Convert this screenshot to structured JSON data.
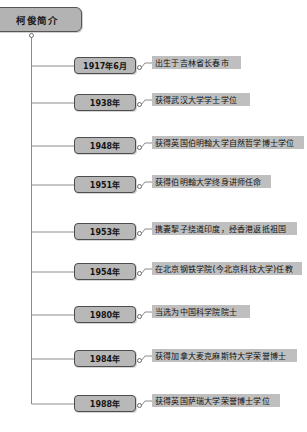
{
  "diagram": {
    "type": "timeline-mindmap",
    "root": {
      "label": "柯俊简介"
    },
    "entries": [
      {
        "date": "1917年6月",
        "description": "出生于吉林省长春市"
      },
      {
        "date": "1938年",
        "description": "获得武汉大学学士学位"
      },
      {
        "date": "1948年",
        "description": "获得英国伯明翰大学自然哲学博士学位"
      },
      {
        "date": "1951年",
        "description": "获得伯明翰大学终身讲师任命"
      },
      {
        "date": "1953年",
        "description": "携妻挈子绕道印度，经香港返抵祖国"
      },
      {
        "date": "1954年",
        "description": "在北京钢铁学院(今北京科技大学)任教"
      },
      {
        "date": "1980年",
        "description": "当选为中国科学院院士"
      },
      {
        "date": "1984年",
        "description": "获得加拿大麦克麻斯特大学荣誉博士"
      },
      {
        "date": "1988年",
        "description": "获得英国萨瑞大学荣誉博士学位"
      }
    ],
    "colors": {
      "node_fill": "#b3b3b3",
      "node_border": "#4d4d4d",
      "desc_fill": "#bfbfbf",
      "line": "#8c8c8c",
      "background": "#ffffff"
    }
  }
}
